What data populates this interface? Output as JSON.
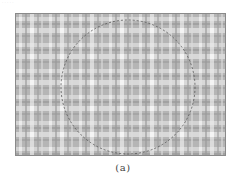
{
  "figure": {
    "caption": "(a)",
    "colors": {
      "background": "#b9b9b9",
      "band_light": "#e6e6e6",
      "band_white": "#f7f7f7",
      "band_dark": "#9c9c9c",
      "circle_stroke": "#555555",
      "frame": "#8a8a8a"
    },
    "circle": {
      "cx": 128,
      "cy": 87,
      "r": 67,
      "style": "dashed"
    }
  },
  "faint_header": "· · · · ·"
}
